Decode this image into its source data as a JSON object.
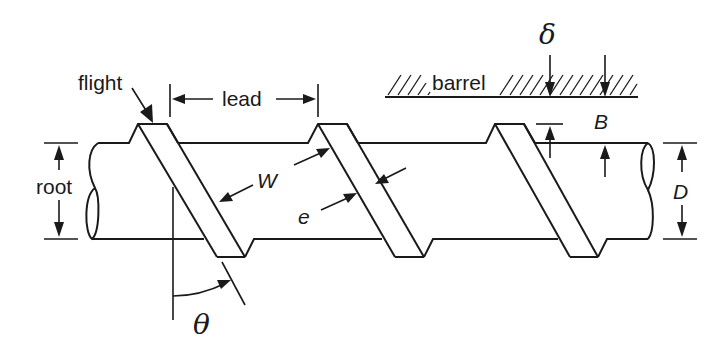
{
  "diagram": {
    "type": "single-screw extruder geometry schematic",
    "labels": {
      "flight": "flight",
      "lead": "lead",
      "barrel": "barrel",
      "root": "root",
      "delta": "δ",
      "B": "B",
      "D": "D",
      "W": "W",
      "e": "e",
      "theta": "θ"
    },
    "components": [
      {
        "name": "screw-root",
        "description": "cylindrical shaft shown with broken ends"
      },
      {
        "name": "flights",
        "count": 3,
        "description": "helical flights inclined at angle θ"
      },
      {
        "name": "barrel",
        "description": "hatched barrel wall above the screw"
      }
    ],
    "dimensions": [
      {
        "symbol": "lead",
        "meaning": "axial distance between successive flights"
      },
      {
        "symbol": "δ",
        "meaning": "flight clearance to barrel"
      },
      {
        "symbol": "B",
        "meaning": "channel depth (flight height)"
      },
      {
        "symbol": "D",
        "meaning": "root diameter"
      },
      {
        "symbol": "W",
        "meaning": "channel width"
      },
      {
        "symbol": "e",
        "meaning": "flight width"
      },
      {
        "symbol": "θ",
        "meaning": "helix angle"
      }
    ]
  }
}
